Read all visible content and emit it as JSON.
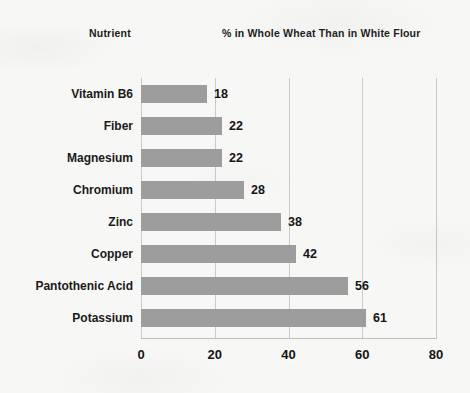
{
  "header": {
    "left_label": "Nutrient",
    "right_label": "% in Whole Wheat Than in White Flour"
  },
  "colors": {
    "bar": "#9d9d9d",
    "gridline": "#c9c9c9",
    "axis": "#bdbdbd",
    "text": "#1a1a1a",
    "background": "#f7f7f5"
  },
  "chart_data": {
    "type": "bar",
    "orientation": "horizontal",
    "title": "% in Whole Wheat Than in White Flour",
    "xlabel": "",
    "ylabel": "Nutrient",
    "xlim": [
      0,
      80
    ],
    "xticks": [
      0,
      20,
      40,
      60,
      80
    ],
    "grid": "vertical",
    "legend": "none",
    "categories": [
      "Vitamin B6",
      "Fiber",
      "Magnesium",
      "Chromium",
      "Zinc",
      "Copper",
      "Pantothenic Acid",
      "Potassium"
    ],
    "values": [
      18,
      22,
      22,
      28,
      38,
      42,
      56,
      61
    ],
    "data_labels": [
      "18",
      "22",
      "22",
      "28",
      "38",
      "42",
      "56",
      "61"
    ]
  }
}
